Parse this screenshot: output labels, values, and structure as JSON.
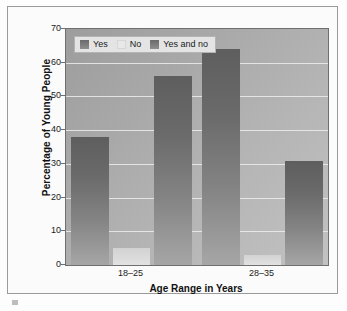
{
  "chart_data": {
    "type": "bar",
    "title": "",
    "categories": [
      "18–25",
      "28–35"
    ],
    "series": [
      {
        "name": "Yes",
        "values": [
          38,
          64
        ]
      },
      {
        "name": "No",
        "values": [
          5,
          3
        ]
      },
      {
        "name": "Yes and no",
        "values": [
          56,
          31
        ]
      }
    ],
    "xlabel": "Age Range in Years",
    "ylabel": "Percentage of Young People",
    "ylim": [
      0,
      70
    ],
    "ytick_step": 10,
    "yticks": [
      0,
      10,
      20,
      30,
      40,
      50,
      60,
      70
    ],
    "ytick_labels": [
      "0",
      "10",
      "20",
      "30",
      "40",
      "50",
      "60",
      "70"
    ],
    "grid": true,
    "legend_position": "upper left",
    "colors": {
      "series_yes": "#6b6b6b",
      "series_no": "#e8e8e8",
      "series_yes_and_no": "#6b6b6b",
      "plot_background": "#a8a8a8",
      "gridline": "#ededed",
      "axis": "#6f6f6f",
      "text": "#1a1a1a",
      "frame": "#9a9a9a"
    }
  },
  "legend": {
    "items": [
      {
        "label": "Yes",
        "swatch": "dark"
      },
      {
        "label": "No",
        "swatch": "light"
      },
      {
        "label": "Yes and no",
        "swatch": "dark"
      }
    ]
  },
  "axes": {
    "y_title": "Percentage of Young People",
    "x_title": "Age Range in Years",
    "y_ticks": [
      "70",
      "60",
      "50",
      "40",
      "30",
      "20",
      "10",
      "0"
    ],
    "x_ticks": [
      "18–25",
      "28–35"
    ]
  }
}
